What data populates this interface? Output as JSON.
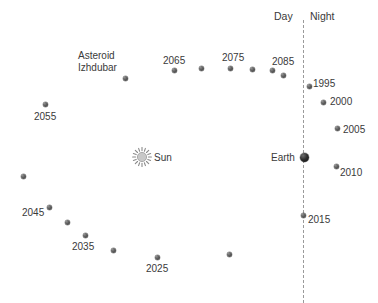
{
  "figure": {
    "title": "",
    "sun": {
      "label": "Sun",
      "icon": "sun-icon",
      "x": 142,
      "y": 157
    },
    "earth": {
      "label": "Earth",
      "icon": "earth-dot-icon",
      "x": 304,
      "y": 157,
      "size": 9
    },
    "terminator": {
      "day_label": "Day",
      "night_label": "Night",
      "x": 303,
      "y_top": 20,
      "y_bottom": 303,
      "color": "#9a9a9a",
      "style": "dashed"
    },
    "asteroid": {
      "name_line1": "Asteroid",
      "name_line2": "Izhdubar",
      "label_x": 78,
      "label_y": 50
    },
    "colors": {
      "marker": "#4a4a4a",
      "text": "#3a3a3a",
      "background": "#ffffff",
      "divider": "#9a9a9a"
    }
  },
  "chart_data": {
    "type": "scatter",
    "title": "",
    "xlabel": "",
    "ylabel": "",
    "annotations": [
      "Day",
      "Night",
      "Sun",
      "Earth",
      "Asteroid Izhdubar"
    ],
    "points": [
      {
        "label": "",
        "x": 125,
        "y": 78,
        "size": 5
      },
      {
        "label": "2065",
        "x": 174,
        "y": 70,
        "size": 5,
        "label_x": 163,
        "label_y": 55
      },
      {
        "label": "",
        "x": 201,
        "y": 68,
        "size": 5
      },
      {
        "label": "2075",
        "x": 230,
        "y": 68,
        "size": 5,
        "label_x": 222,
        "label_y": 52
      },
      {
        "label": "",
        "x": 252,
        "y": 69,
        "size": 5
      },
      {
        "label": "2085",
        "x": 272,
        "y": 70,
        "size": 5,
        "label_x": 272,
        "label_y": 56
      },
      {
        "label": "",
        "x": 283,
        "y": 75,
        "size": 5
      },
      {
        "label": "1995",
        "x": 309,
        "y": 86,
        "size": 5,
        "label_x": 313,
        "label_y": 78
      },
      {
        "label": "2000",
        "x": 323,
        "y": 102,
        "size": 5,
        "label_x": 330,
        "label_y": 96
      },
      {
        "label": "2005",
        "x": 337,
        "y": 128,
        "size": 5,
        "label_x": 343,
        "label_y": 124
      },
      {
        "label": "2010",
        "x": 336,
        "y": 166,
        "size": 5,
        "label_x": 340,
        "label_y": 167
      },
      {
        "label": "2015",
        "x": 303,
        "y": 215,
        "size": 5,
        "label_x": 308,
        "label_y": 214
      },
      {
        "label": "",
        "x": 229,
        "y": 254,
        "size": 5
      },
      {
        "label": "2025",
        "x": 157,
        "y": 257,
        "size": 5,
        "label_x": 146,
        "label_y": 263
      },
      {
        "label": "",
        "x": 113,
        "y": 250,
        "size": 5
      },
      {
        "label": "2035",
        "x": 85,
        "y": 235,
        "size": 5,
        "label_x": 72,
        "label_y": 241
      },
      {
        "label": "",
        "x": 67,
        "y": 222,
        "size": 5
      },
      {
        "label": "2045",
        "x": 49,
        "y": 207,
        "size": 5,
        "label_x": 22,
        "label_y": 207
      },
      {
        "label": "",
        "x": 23,
        "y": 176,
        "size": 5
      },
      {
        "label": "2055",
        "x": 45,
        "y": 104,
        "size": 5,
        "label_x": 34,
        "label_y": 111
      }
    ]
  }
}
